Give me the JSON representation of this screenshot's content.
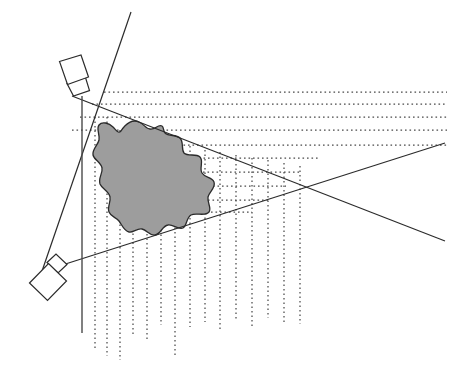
{
  "figure": {
    "title": "Two-sensor viewing wedge over an irregular region",
    "width": 457,
    "height": 374,
    "background_color": "#ffffff"
  },
  "colors": {
    "blob_fill": "#9d9d9d",
    "outline": "#2b2b2b",
    "dotted_grid": "#4a4a4a",
    "sensor_fill": "#ffffff",
    "page_background": "#ffffff"
  },
  "sensors": [
    {
      "id": "upper-sensor",
      "label": "upper sensor",
      "body_points": "59.5,61.5 81.0,55.0 88.5,77.0 67.5,84.5",
      "neck_points": "67.0,83.5 85.5,77.5 89.5,90.5 73.5,96.0",
      "aperture_x": 79,
      "aperture_y": 95
    },
    {
      "id": "lower-sensor",
      "label": "lower sensor",
      "body_points": "29.5,283.0 48.5,263.5 66.5,281.0 47.5,300.5",
      "neck_points": "47.0,262.5 56.0,254.0 67.0,264.5 58.0,273.0",
      "aperture_x": 60,
      "aperture_y": 262
    }
  ],
  "solid_lines": [
    {
      "id": "wedge-upper-ray",
      "label": "upper wedge boundary ray",
      "x1": 72,
      "y1": 96,
      "x2": 445,
      "y2": 241
    },
    {
      "id": "wedge-lower-ray",
      "label": "lower wedge boundary ray",
      "x1": 56,
      "y1": 267,
      "x2": 445,
      "y2": 143
    },
    {
      "id": "sensor-baseline",
      "label": "sensor-to-sensor baseline",
      "x1": 131,
      "y1": 12,
      "x2": 40,
      "y2": 277
    }
  ],
  "vertical_axis": {
    "id": "vertical-reference-line",
    "label": "vertical reference line",
    "x": 82,
    "y_top": 96,
    "y_bottom": 333
  },
  "region": {
    "id": "shaded-region",
    "label": "irregular shaded region",
    "fill": "#9d9d9d",
    "path": "M 121 131 C 126 123 133 119 139 122 C 144 124 146 129 150 129 C 155 130 158 124 162 126 C 164 127 163 131 165 133 C 169 137 176 134 180 138 C 184 142 181 149 184 153 C 188 157 196 153 200 157 C 204 161 199 168 202 173 C 205 178 212 177 214 182 C 216 188 209 192 208 197 C 207 203 212 208 209 212 C 205 217 196 212 191 215 C 186 218 187 226 183 228 C 178 230 173 224 168 225 C 162 226 161 234 155 235 C 150 236 147 230 142 229 C 137 228 133 233 129 232 C 124 231 122 225 119 221 C 116 217 111 217 109 212 C 107 207 111 202 110 197 C 109 191 102 189 100 184 C 98 178 103 173 102 168 C 101 162 94 160 93 155 C 92 149 98 145 99 140 C 100 134 96 129 99 125 C 102 121 109 123 113 127 C 116 130 118 134 121 131 Z"
  },
  "dotted_horizontal_lines": [
    {
      "id": "h-1",
      "y": 92,
      "x1": 104,
      "x2": 447
    },
    {
      "id": "h-2",
      "y": 104,
      "x1": 92,
      "x2": 447
    },
    {
      "id": "h-3",
      "y": 117,
      "x1": 80,
      "x2": 447
    },
    {
      "id": "h-4",
      "y": 130,
      "x1": 72,
      "x2": 447
    },
    {
      "id": "h-5",
      "y": 145,
      "x1": 152,
      "x2": 447
    },
    {
      "id": "h-6",
      "y": 158,
      "x1": 163,
      "x2": 320
    },
    {
      "id": "h-7",
      "y": 172,
      "x1": 176,
      "x2": 300
    },
    {
      "id": "h-8",
      "y": 186,
      "x1": 186,
      "x2": 286
    },
    {
      "id": "h-9",
      "y": 200,
      "x1": 190,
      "x2": 268
    },
    {
      "id": "h-10",
      "y": 212,
      "x1": 184,
      "x2": 252
    }
  ],
  "dotted_vertical_lines": [
    {
      "id": "v-1",
      "x": 95,
      "y1": 117,
      "y2": 350
    },
    {
      "id": "v-2",
      "x": 107,
      "y1": 117,
      "y2": 356
    },
    {
      "id": "v-3",
      "x": 120,
      "y1": 130,
      "y2": 360
    },
    {
      "id": "v-4",
      "x": 133,
      "y1": 130,
      "y2": 334
    },
    {
      "id": "v-5",
      "x": 147,
      "y1": 135,
      "y2": 342
    },
    {
      "id": "v-6",
      "x": 161,
      "y1": 140,
      "y2": 325
    },
    {
      "id": "v-7",
      "x": 175,
      "y1": 142,
      "y2": 355
    },
    {
      "id": "v-8",
      "x": 190,
      "y1": 146,
      "y2": 327
    },
    {
      "id": "v-9",
      "x": 205,
      "y1": 150,
      "y2": 322
    },
    {
      "id": "v-10",
      "x": 220,
      "y1": 152,
      "y2": 330
    },
    {
      "id": "v-11",
      "x": 236,
      "y1": 155,
      "y2": 320
    },
    {
      "id": "v-12",
      "x": 252,
      "y1": 158,
      "y2": 326
    },
    {
      "id": "v-13",
      "x": 268,
      "y1": 160,
      "y2": 318
    },
    {
      "id": "v-14",
      "x": 284,
      "y1": 163,
      "y2": 322
    },
    {
      "id": "v-15",
      "x": 300,
      "y1": 166,
      "y2": 324
    }
  ]
}
